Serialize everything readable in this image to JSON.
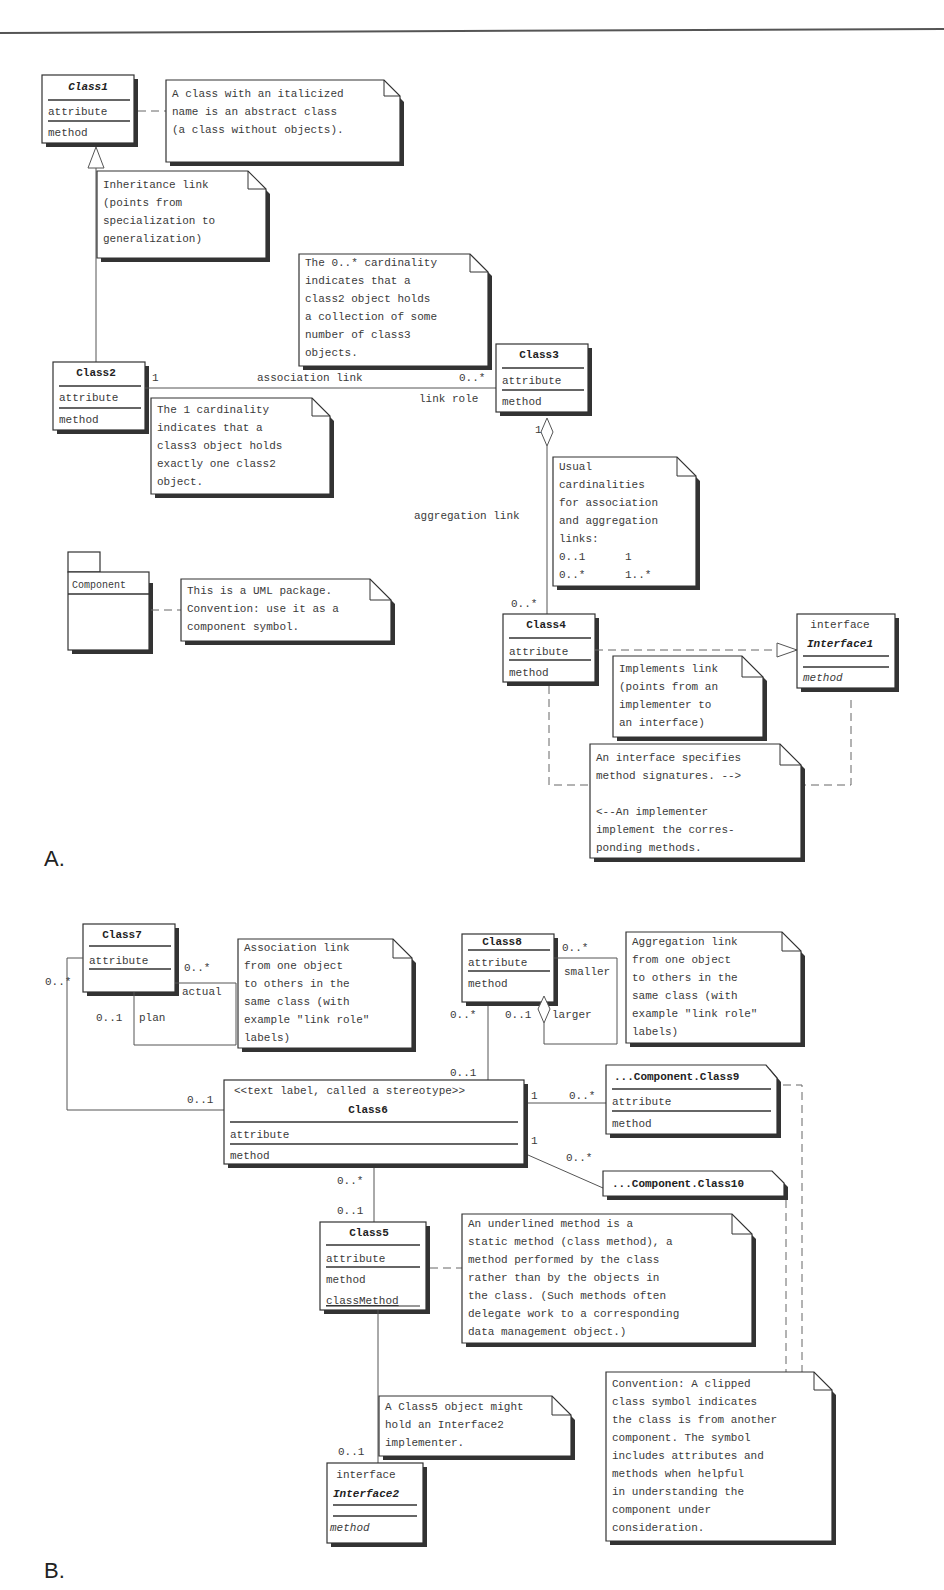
{
  "sections": {
    "a_label": "A.",
    "b_label": "B."
  },
  "diagram_a": {
    "class1": {
      "name": "Class1",
      "attribute": "attribute",
      "method": "method"
    },
    "note_abstract": [
      "A class with an italicized",
      "name is an abstract class",
      "(a class without objects)."
    ],
    "note_inheritance": [
      "Inheritance link",
      "(points from",
      "specialization to",
      "generalization)"
    ],
    "note_cardinality_many": [
      "The 0..* cardinality",
      "indicates that a",
      "class2 object holds",
      "a collection of some",
      "number of class3",
      "objects."
    ],
    "class2": {
      "name": "Class2",
      "attribute": "attribute",
      "method": "method"
    },
    "class3": {
      "name": "Class3",
      "attribute": "attribute",
      "method": "method"
    },
    "assoc": {
      "left_mult": "1",
      "label": "association link",
      "right_mult": "0..*",
      "role": "link role"
    },
    "note_cardinality_one": [
      "The 1 cardinality",
      "indicates that a",
      "class3 object holds",
      "exactly one class2",
      "object."
    ],
    "aggregation": {
      "top_mult": "1",
      "label": "aggregation link",
      "bottom_mult": "0..*"
    },
    "note_usual": [
      "Usual",
      "cardinalities",
      "for association",
      "and aggregation",
      "links:",
      "0..1      1",
      "0..*      1..*"
    ],
    "package": {
      "name": "Component"
    },
    "note_package": [
      "This is a UML package.",
      "Convention: use it as a",
      "component symbol."
    ],
    "class4": {
      "name": "Class4",
      "attribute": "attribute",
      "method": "method"
    },
    "interface1": {
      "stereotype": "interface",
      "name": "Interface1",
      "method": "method"
    },
    "note_implements": [
      "Implements link",
      "(points from an",
      "implementer to",
      "an interface)"
    ],
    "note_interface": [
      "An interface specifies",
      "method signatures. -->",
      "",
      "<--An implementer",
      "implement the corres-",
      "ponding methods."
    ]
  },
  "diagram_b": {
    "class7": {
      "name": "Class7",
      "attribute": "attribute"
    },
    "class7_self": {
      "mult_top": "0..*",
      "role_top": "actual",
      "mult_bottom": "0..1",
      "role_bottom": "plan"
    },
    "class7_to_6": {
      "mult_class7": "0..*",
      "mult_class6": "0..1"
    },
    "note_assoc_self": [
      "Association link",
      "from one object",
      "to others in the",
      "same class (with",
      "example \"link role\"",
      "labels)"
    ],
    "class8": {
      "name": "Class8",
      "attribute": "attribute",
      "method": "method"
    },
    "class8_self": {
      "mult_top": "0..*",
      "role_top": "smaller",
      "mult_bottom": "0..1",
      "role_bottom": "larger"
    },
    "class8_to_6": {
      "mult_class8": "0..*",
      "mult_class6": "0..1"
    },
    "note_aggr_self": [
      "Aggregation link",
      "from one object",
      "to others in the",
      "same class (with",
      "example \"link role\"",
      "labels)"
    ],
    "class6": {
      "stereotype": "<<text label, called a stereotype>>",
      "name": "Class6",
      "attribute": "attribute",
      "method": "method"
    },
    "class9": {
      "name": "...Component.Class9",
      "attribute": "attribute",
      "method": "method"
    },
    "class6_to_9": {
      "mult_class6": "1",
      "mult_class9": "0..*"
    },
    "class10": {
      "name": "...Component.Class10"
    },
    "class6_to_10": {
      "mult_class6": "1",
      "mult_class10": "0..*"
    },
    "class6_to_5": {
      "mult_class6": "0..*",
      "mult_class5": "0..1"
    },
    "class5": {
      "name": "Class5",
      "attribute": "attribute",
      "method": "method",
      "class_method": "classMethod"
    },
    "note_static": [
      "An underlined method is a",
      "static method (class method), a",
      "method performed by the class",
      "rather than by the objects in",
      "the class. (Such methods often",
      "delegate work to a corresponding",
      "data management object.)"
    ],
    "note_interface2": [
      "A Class5 object might",
      "hold an Interface2",
      "implementer."
    ],
    "class5_to_i2": {
      "mult_interface2": "0..1"
    },
    "interface2": {
      "stereotype": "interface",
      "name": "Interface2",
      "method": "method"
    },
    "note_clipped": [
      "Convention: A clipped",
      "class symbol indicates",
      "the class is from another",
      "component. The symbol",
      "includes attributes and",
      "methods when helpful",
      "in understanding the",
      "component under",
      "consideration."
    ]
  }
}
